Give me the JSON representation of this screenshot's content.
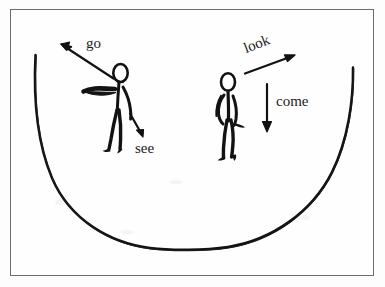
{
  "figure": {
    "kind": "hand-drawn-illustration",
    "background_color": "#fdfdfd",
    "ink_color": "#111111",
    "frame_color": "#6d6d6d"
  },
  "labels": {
    "go": "go",
    "see": "see",
    "look": "look",
    "come": "come"
  },
  "arrows": [
    {
      "id": "go-arrow",
      "label": "go",
      "direction": "up-left",
      "from": [
        113,
        78
      ],
      "to": [
        61,
        45
      ],
      "attached_to": "left-figure-arm"
    },
    {
      "id": "see-arrow",
      "label": "see",
      "direction": "down-right",
      "from": [
        131,
        114
      ],
      "to": [
        143,
        136
      ],
      "attached_to": "left-figure"
    },
    {
      "id": "look-arrow",
      "label": "look",
      "direction": "up-right",
      "from": [
        244,
        72
      ],
      "to": [
        294,
        55
      ],
      "attached_to": "right-figure"
    },
    {
      "id": "come-arrow",
      "label": "come",
      "direction": "down",
      "from": [
        267,
        84
      ],
      "to": [
        267,
        131
      ],
      "attached_to": "right-figure"
    }
  ],
  "figures": [
    {
      "id": "left-figure",
      "pose": "standing, left arm extended pointing up-left",
      "head_center": [
        120,
        73
      ],
      "foot_y": 148
    },
    {
      "id": "right-figure",
      "pose": "walking forward, arms down at sides",
      "head_center": [
        228,
        82
      ],
      "foot_y": 158
    }
  ],
  "curve": {
    "id": "u-curve",
    "shape": "wide-u",
    "left_end": [
      35,
      55
    ],
    "bottom": [
      192,
      249
    ],
    "right_end": [
      353,
      67
    ]
  }
}
